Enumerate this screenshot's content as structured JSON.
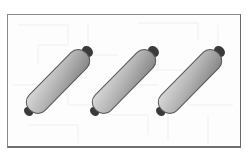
{
  "scene": {
    "description": "Three identical rolled tubes inside a framed panel with faint maze background",
    "object_count": 3,
    "objects": [
      {
        "name": "tube-1",
        "top_cap": [
          88,
          51
        ],
        "bottom_cap": [
          28,
          112
        ]
      },
      {
        "name": "tube-2",
        "top_cap": [
          154,
          51
        ],
        "bottom_cap": [
          94,
          112
        ]
      },
      {
        "name": "tube-3",
        "top_cap": [
          220,
          51
        ],
        "bottom_cap": [
          160,
          112
        ]
      }
    ],
    "colors": {
      "frame": "#8a8a8a",
      "tube_light": "#d4d4d4",
      "tube_dark": "#8e8e8e",
      "tube_outline": "#555555",
      "cap": "#3a3a3a",
      "maze_lines": "#eeeeee"
    }
  }
}
